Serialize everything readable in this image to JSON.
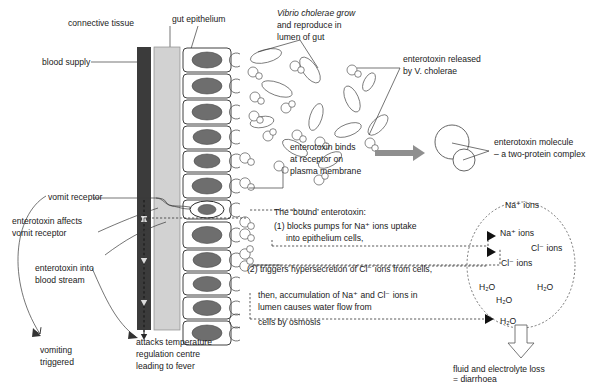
{
  "diagram": {
    "labels": {
      "connective_tissue": "connective tissue",
      "gut_epithelium": "gut epithelium",
      "blood_supply": "blood supply",
      "vibrio_grow_l1": "Vibrio cholerae grow",
      "vibrio_grow_l2": "and reproduce in",
      "vibrio_grow_l3": "lumen of gut",
      "enterotoxin_released_l1": "enterotoxin released",
      "enterotoxin_released_l2": "by V. cholerae",
      "enterotoxin_molecule_l1": "enterotoxin molecule",
      "enterotoxin_molecule_l2": "– a two-protein complex",
      "binds_l1": "enterotoxin binds",
      "binds_l2": "at receptor on",
      "binds_l3": "plasma membrane",
      "vomit_receptor": "vomit receptor",
      "affects_vomit_l1": "enterotoxin affects",
      "affects_vomit_l2": "vomit receptor",
      "into_blood_l1": "enterotoxin into",
      "into_blood_l2": "blood stream",
      "vomiting_l1": "vomiting",
      "vomiting_l2": "triggered",
      "fever_l1": "attacks temperature",
      "fever_l2": "regulation centre",
      "fever_l3": "leading to fever",
      "bound_intro": "The ‘bound’ enterotoxin:",
      "bound_1a": "(1) blocks pumps for Na⁺ ions uptake",
      "bound_1b": "into epithelium cells,",
      "bound_2": "(2) triggers hypersecretion of Cl⁻ ions from cells,",
      "bound_3a": "then, accumulation of Na⁺ and Cl⁻ ions in",
      "bound_3b": "lumen causes water flow from",
      "bound_3c": "cells by osmosis",
      "na_ions": "Na⁺ ions",
      "cl_ions": "Cl⁻ ions",
      "water": "H₂O",
      "diarrhoea_l1": "fluid and electrolyte loss",
      "diarrhoea_l2": "= diarrhoea"
    },
    "colors": {
      "blood_column": "#3b3b3b",
      "connective_tissue": "#d2d2d2",
      "nucleus": "#6e6e6e",
      "cell_outline": "#2b2b2b",
      "arrow_gray": "#8f8f8f",
      "text": "#1a1a1a"
    },
    "counts": {
      "epithelial_cells": 13,
      "bacteria_rods": 11,
      "toxin_molecules": 16
    }
  }
}
